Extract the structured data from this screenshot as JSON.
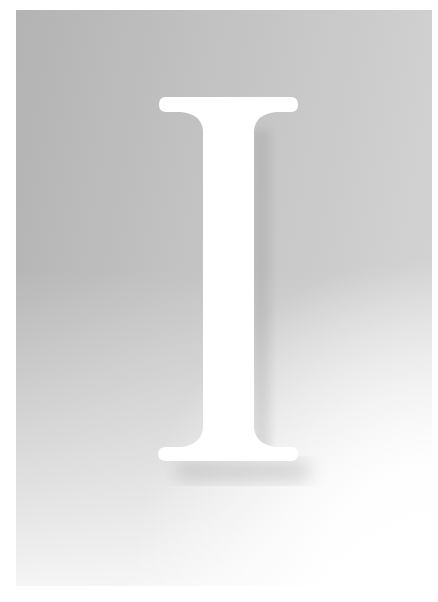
{
  "artwork": {
    "letter": "I",
    "colors": {
      "background": "#ffffff",
      "panel_dark": "#b3b3b3",
      "panel_light": "#d6d6d6",
      "letter_fill": "#ffffff"
    }
  }
}
